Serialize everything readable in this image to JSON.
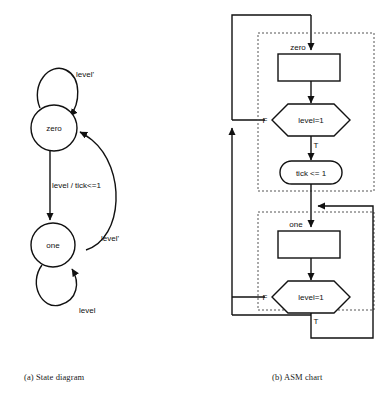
{
  "figure": {
    "captions": {
      "a": "(a) State diagram",
      "b": "(b) ASM chart"
    }
  },
  "state_diagram": {
    "title": "State diagram",
    "states": [
      {
        "id": "zero",
        "label": "zero",
        "cx": 54,
        "cy": 128,
        "r": 23
      },
      {
        "id": "one",
        "label": "one",
        "cx": 53,
        "cy": 245,
        "r": 22
      }
    ],
    "transitions": [
      {
        "id": "zero-self",
        "from": "zero",
        "to": "zero",
        "label": "level'",
        "label_x": 76,
        "label_y": 77
      },
      {
        "id": "zero-to-one",
        "from": "zero",
        "to": "one",
        "label": "level / tick<=1",
        "label_x": 52,
        "label_y": 185
      },
      {
        "id": "one-to-zero",
        "from": "one",
        "to": "zero",
        "label": "level'",
        "label_x": 101,
        "label_y": 238
      },
      {
        "id": "one-self",
        "from": "one",
        "to": "one",
        "label": "level",
        "label_x": 79,
        "label_y": 310
      }
    ]
  },
  "asm_chart": {
    "title": "ASM chart",
    "blocks": [
      {
        "id": "zero-block",
        "state_label": "zero",
        "state_box": {
          "x": 278,
          "y": 54,
          "w": 62,
          "h": 27
        },
        "decision": {
          "label": "level=1",
          "false_label": "F",
          "true_label": "T"
        },
        "output": {
          "label": "tick <= 1"
        }
      },
      {
        "id": "one-block",
        "state_label": "one",
        "state_box": {
          "x": 278,
          "y": 231,
          "w": 62,
          "h": 27
        },
        "decision": {
          "label": "level=1",
          "false_label": "F",
          "true_label": "T"
        },
        "output": null
      }
    ],
    "labels": {
      "zero_state": "zero",
      "one_state": "one",
      "decision_zero": "level=1",
      "decision_one": "level=1",
      "output_tick": "tick <= 1",
      "false_zero": "F",
      "true_zero": "T",
      "false_one": "F",
      "true_one": "T"
    }
  },
  "colors": {
    "ink": "#111111",
    "dashed": "#555555",
    "paper": "#ffffff"
  }
}
